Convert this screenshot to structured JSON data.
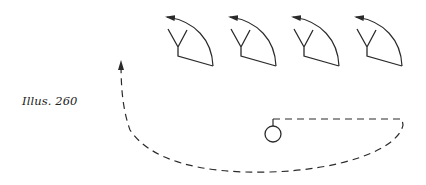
{
  "caption": "Illus. 260",
  "colors": {
    "stroke": "#2a2a2a",
    "background": "#ffffff"
  },
  "figures": [
    {
      "id": "player-1",
      "x": 0
    },
    {
      "id": "player-2",
      "x": 63
    },
    {
      "id": "player-3",
      "x": 126
    },
    {
      "id": "player-4",
      "x": 189
    }
  ],
  "elements": {
    "player_symbol": "Y-shaped player with curved rotation arrow",
    "ball_symbol": "circle",
    "path_style": "dashed"
  }
}
